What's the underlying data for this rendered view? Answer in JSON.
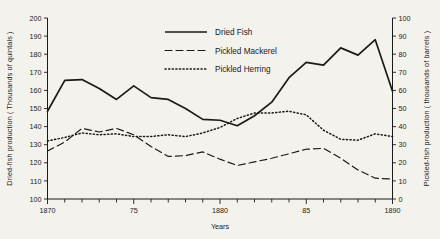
{
  "chart_data": {
    "type": "line",
    "title": "",
    "xlabel": "Years",
    "ylabel": "Dried-fish production ( Thousands of quintals )",
    "y2label": "Pickled-fish production ( thousands of barrels )",
    "xlim": [
      1870,
      1890
    ],
    "ylim": [
      100,
      200
    ],
    "y2lim": [
      0,
      100
    ],
    "grid": false,
    "legend_position": "top-center",
    "x_tick_labels": [
      "1870",
      "75",
      "1880",
      "85",
      "1890"
    ],
    "x_tick_values": [
      1870,
      1875,
      1880,
      1885,
      1890
    ],
    "x_minor_tick_step": 1,
    "y_tick_labels": [
      "100",
      "110",
      "120",
      "130",
      "140",
      "150",
      "160",
      "170",
      "180",
      "190",
      "200"
    ],
    "y_tick_values": [
      100,
      110,
      120,
      130,
      140,
      150,
      160,
      170,
      180,
      190,
      200
    ],
    "y2_tick_labels": [
      "0",
      "10",
      "20",
      "30",
      "40",
      "50",
      "60",
      "70",
      "80",
      "90",
      "100"
    ],
    "y2_tick_values": [
      0,
      10,
      20,
      30,
      40,
      50,
      60,
      70,
      80,
      90,
      100
    ],
    "x": [
      1870,
      1871,
      1872,
      1873,
      1874,
      1875,
      1876,
      1877,
      1878,
      1879,
      1880,
      1881,
      1882,
      1883,
      1884,
      1885,
      1886,
      1887,
      1888,
      1889,
      1890
    ],
    "series": [
      {
        "name": "Dried Fish",
        "axis": "left",
        "style": "solid",
        "color": "#1a1a1a",
        "values": [
          148.5,
          165.5,
          166,
          161,
          155,
          162.5,
          156,
          155,
          150,
          144,
          143.5,
          140.5,
          146,
          153.5,
          167,
          175.5,
          174,
          183.5,
          179.5,
          188,
          159.5
        ]
      },
      {
        "name": "Pickled Mackerel",
        "axis": "right",
        "style": "dashed",
        "color": "#1a1a1a",
        "values": [
          26.5,
          31.5,
          39,
          37,
          39,
          35.5,
          29,
          23.5,
          24,
          26,
          22,
          18.5,
          20.5,
          22.5,
          25,
          27.5,
          28,
          22.5,
          16,
          11.5,
          11
        ]
      },
      {
        "name": "Pickled Herring",
        "axis": "right",
        "style": "dotted",
        "color": "#1a1a1a",
        "values": [
          32,
          34,
          36.5,
          35.5,
          36,
          34.5,
          34.5,
          35.5,
          34.5,
          36.5,
          39.5,
          44.5,
          47.5,
          47.5,
          48.5,
          46.5,
          38,
          33,
          32.5,
          36,
          34.5
        ]
      }
    ]
  },
  "legend": {
    "items": [
      {
        "label": "Dried Fish",
        "style": "solid"
      },
      {
        "label": "Pickled Mackerel",
        "style": "dashed"
      },
      {
        "label": "Pickled Herring",
        "style": "dotted"
      }
    ]
  }
}
